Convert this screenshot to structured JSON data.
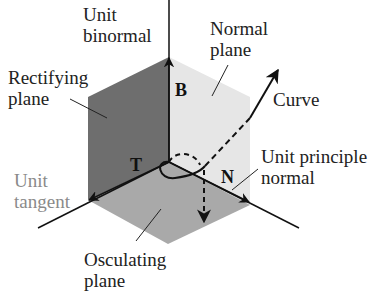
{
  "diagram": {
    "labels": {
      "binormal": [
        "Unit",
        "binormal"
      ],
      "normal_plane": [
        "Normal",
        "plane"
      ],
      "rectifying_plane": [
        "Rectifying",
        "plane"
      ],
      "curve": "Curve",
      "tangent": [
        "Unit",
        "tangent"
      ],
      "principal_normal": [
        "Unit principle",
        "normal"
      ],
      "osculating_plane": [
        "Osculating",
        "plane"
      ]
    },
    "vectors": {
      "B": "B",
      "T": "T",
      "N": "N"
    },
    "colors": {
      "rectifying_plane": "#6e6e6e",
      "normal_plane": "#e6e6e6",
      "osculating_plane": "#a9a9a9",
      "tangent_label": "#8a8a8a",
      "lines": "#111111"
    }
  }
}
